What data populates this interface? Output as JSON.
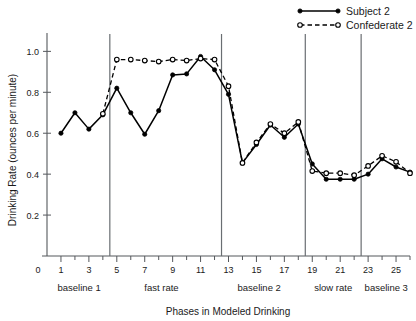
{
  "chart_data": {
    "type": "line",
    "title": "",
    "xlabel": "Phases in Modeled Drinking",
    "ylabel": "Drinking Rate (ounces per minute)",
    "xlim": [
      0,
      26
    ],
    "ylim": [
      0,
      1.08
    ],
    "grid": false,
    "legend_position": "top-right",
    "x": [
      1,
      2,
      3,
      4,
      5,
      6,
      7,
      8,
      9,
      10,
      11,
      12,
      13,
      14,
      15,
      16,
      17,
      18,
      19,
      20,
      21,
      22,
      23,
      24,
      25,
      26
    ],
    "x_tick_labels": [
      "0",
      "1",
      "3",
      "5",
      "7",
      "9",
      "11",
      "13",
      "15",
      "17",
      "19",
      "21",
      "23",
      "25"
    ],
    "x_tick_values": [
      0,
      1,
      3,
      5,
      7,
      9,
      11,
      13,
      15,
      17,
      19,
      21,
      23,
      25
    ],
    "y_tick_labels": [
      "0.2",
      "0.4",
      "0.6",
      "0.8",
      "1.0"
    ],
    "y_tick_values": [
      0.2,
      0.4,
      0.6,
      0.8,
      1.0
    ],
    "series": [
      {
        "name": "Subject 2",
        "style": "solid",
        "marker": "filled-circle",
        "color": "#000000",
        "values": [
          0.6,
          0.7,
          0.62,
          0.69,
          0.82,
          0.7,
          0.595,
          0.71,
          0.885,
          0.89,
          0.975,
          0.91,
          0.79,
          0.455,
          0.545,
          0.64,
          0.58,
          0.645,
          0.45,
          0.375,
          0.375,
          0.375,
          0.4,
          0.475,
          0.435,
          0.41
        ]
      },
      {
        "name": "Confederate 2",
        "style": "dashed",
        "marker": "open-circle",
        "color": "#000000",
        "values": [
          null,
          null,
          null,
          0.695,
          0.96,
          0.96,
          0.955,
          0.95,
          0.96,
          0.955,
          0.965,
          0.96,
          0.83,
          0.455,
          0.555,
          0.645,
          0.6,
          0.655,
          0.415,
          0.405,
          0.405,
          0.395,
          0.44,
          0.49,
          0.46,
          0.405
        ]
      }
    ],
    "phase_dividers": [
      4.5,
      12.5,
      18.5,
      22.5
    ],
    "phases": [
      {
        "label": "baseline 1",
        "center": 2.3
      },
      {
        "label": "fast rate",
        "center": 8.2
      },
      {
        "label": "baseline 2",
        "center": 15.2
      },
      {
        "label": "slow rate",
        "center": 20.5
      },
      {
        "label": "baseline 3",
        "center": 24.3
      }
    ]
  },
  "legend": {
    "entries": [
      {
        "label": "Subject 2"
      },
      {
        "label": "Confederate 2"
      }
    ]
  },
  "axes": {
    "y_title": "Drinking Rate (ounces per minute)",
    "x_title": "Phases in Modeled Drinking"
  }
}
